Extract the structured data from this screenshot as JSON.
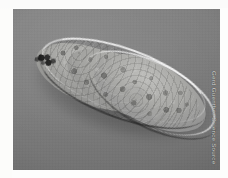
{
  "page": {
    "background_color": "#fdfdfc"
  },
  "photo": {
    "subject": "paramecium-microscopy",
    "description": "Grayscale light-microscope photograph of a single elongated slipper-shaped protozoan (paramecium) with granular cytoplasm, lying diagonally on a uniform gray background",
    "background_color": "#7a7a7a",
    "body_color": "#a5a5a2",
    "highlight_color": "#ffffff",
    "shadow_color": "#1c1c1c",
    "frame": {
      "left": 13,
      "top": 9,
      "width": 207,
      "height": 161
    },
    "features": [
      {
        "name": "anterior-tip",
        "label": "Anterior end"
      },
      {
        "name": "dark-pigment-cluster",
        "label": "Dark granule cluster"
      },
      {
        "name": "posterior-tip",
        "label": "Posterior end"
      },
      {
        "name": "cytoplasm-granules",
        "label": "Granular cytoplasm"
      }
    ]
  },
  "credit": {
    "text": "Gerd Guenther Science Source",
    "color": "#dcdcdc",
    "orientation": "vertical"
  }
}
